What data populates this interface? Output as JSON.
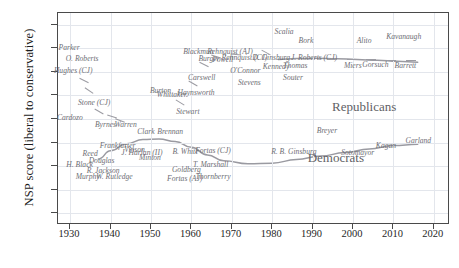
{
  "chart_data": {
    "type": "scatter",
    "title": "",
    "xlabel": "",
    "ylabel": "NSP score (liberal to conservative)",
    "xlim": [
      1927,
      2024
    ],
    "ylim": [
      -0.9,
      0.9
    ],
    "grid": true,
    "legend_position": "inline-annotation",
    "xticks": [
      "1930",
      "1940",
      "1950",
      "1960",
      "1970",
      "1980",
      "1990",
      "2000",
      "2010",
      "2020"
    ],
    "xtick_values": [
      1930,
      1940,
      1950,
      1960,
      1970,
      1980,
      1990,
      2000,
      2010,
      2020
    ],
    "yticks": [
      "0.8",
      "0.6",
      "0.4",
      "0.2",
      "0.0",
      "−0.2",
      "−0.4",
      "−0.6",
      "−0.8"
    ],
    "ytick_values": [
      0.8,
      0.6,
      0.4,
      0.2,
      0.0,
      -0.2,
      -0.4,
      -0.6,
      -0.8
    ],
    "annotations": [
      {
        "text": "Republicans",
        "x": 2003,
        "y": 0.09
      },
      {
        "text": "Democrats",
        "x": 1996,
        "y": -0.34
      }
    ],
    "points": [
      {
        "label": "Parker",
        "x": 1930.0,
        "y": 0.6
      },
      {
        "label": "O. Roberts",
        "x": 1933.2,
        "y": 0.51
      },
      {
        "label": "Hughes (CJ)",
        "x": 1931.0,
        "y": 0.41
      },
      {
        "label": "Cardozo",
        "x": 1930.2,
        "y": 0.01
      },
      {
        "label": "Stone (CJ)",
        "x": 1936.2,
        "y": 0.14
      },
      {
        "label": "Byrnes",
        "x": 1939.0,
        "y": -0.05
      },
      {
        "label": "Warren",
        "x": 1944.0,
        "y": -0.05
      },
      {
        "label": "Reed",
        "x": 1935.2,
        "y": -0.3
      },
      {
        "label": "H. Black",
        "x": 1932.6,
        "y": -0.39
      },
      {
        "label": "Murphy",
        "x": 1934.6,
        "y": -0.49
      },
      {
        "label": "Douglas",
        "x": 1938.0,
        "y": -0.36
      },
      {
        "label": "R. Jackson",
        "x": 1938.4,
        "y": -0.44
      },
      {
        "label": "W. Rutledge",
        "x": 1941.2,
        "y": -0.49
      },
      {
        "label": "Frankfurter",
        "x": 1942.0,
        "y": -0.23
      },
      {
        "label": "Vinson",
        "x": 1946.2,
        "y": -0.26
      },
      {
        "label": "J. Harlan (II)",
        "x": 1948.0,
        "y": -0.29
      },
      {
        "label": "Minton",
        "x": 1950.0,
        "y": -0.33
      },
      {
        "label": "Clark",
        "x": 1949.0,
        "y": -0.11
      },
      {
        "label": "Brennan",
        "x": 1955.0,
        "y": -0.11
      },
      {
        "label": "Burton",
        "x": 1952.6,
        "y": 0.24
      },
      {
        "label": "Whittaker",
        "x": 1955.4,
        "y": 0.2
      },
      {
        "label": "Stewart",
        "x": 1959.4,
        "y": 0.06
      },
      {
        "label": "B. White",
        "x": 1958.8,
        "y": -0.28
      },
      {
        "label": "Goldberg",
        "x": 1959.0,
        "y": -0.43
      },
      {
        "label": "Fortas (AJ)",
        "x": 1958.6,
        "y": -0.51
      },
      {
        "label": "Fortas (CJ)",
        "x": 1965.6,
        "y": -0.27
      },
      {
        "label": "T. Marshall",
        "x": 1965.0,
        "y": -0.39
      },
      {
        "label": "Thornberry",
        "x": 1965.6,
        "y": -0.49
      },
      {
        "label": "Haynsworth",
        "x": 1961.4,
        "y": 0.22
      },
      {
        "label": "Carswell",
        "x": 1962.8,
        "y": 0.35
      },
      {
        "label": "Blackmun",
        "x": 1962.0,
        "y": 0.57
      },
      {
        "label": "Burger",
        "x": 1964.6,
        "y": 0.51
      },
      {
        "label": "Powell",
        "x": 1968.0,
        "y": 0.5
      },
      {
        "label": "Rehnquist (AJ)",
        "x": 1969.8,
        "y": 0.57
      },
      {
        "label": "Rehnquist (CJ)",
        "x": 1973.4,
        "y": 0.52
      },
      {
        "label": "O'Connor",
        "x": 1973.6,
        "y": 0.41
      },
      {
        "label": "Stevens",
        "x": 1974.6,
        "y": 0.31
      },
      {
        "label": "Scalia",
        "x": 1983.2,
        "y": 0.74
      },
      {
        "label": "Bork",
        "x": 1988.6,
        "y": 0.66
      },
      {
        "label": "D. Ginsburg",
        "x": 1980.0,
        "y": 0.52
      },
      {
        "label": "Kennedy",
        "x": 1981.2,
        "y": 0.44
      },
      {
        "label": "Souter",
        "x": 1985.4,
        "y": 0.35
      },
      {
        "label": "Thomas",
        "x": 1986.0,
        "y": 0.45
      },
      {
        "label": "J. Roberts (CJ)",
        "x": 1990.6,
        "y": 0.52
      },
      {
        "label": "Alito",
        "x": 2003.0,
        "y": 0.66
      },
      {
        "label": "Kavanaugh",
        "x": 2012.8,
        "y": 0.7
      },
      {
        "label": "Miers",
        "x": 2000.2,
        "y": 0.45
      },
      {
        "label": "Gorsuch",
        "x": 2005.8,
        "y": 0.46
      },
      {
        "label": "Barrett",
        "x": 2013.2,
        "y": 0.45
      },
      {
        "label": "R. B. Ginsburg",
        "x": 1985.6,
        "y": -0.28
      },
      {
        "label": "Breyer",
        "x": 1993.8,
        "y": -0.1
      },
      {
        "label": "Sotomayor",
        "x": 2001.4,
        "y": -0.29
      },
      {
        "label": "Kagan",
        "x": 2008.4,
        "y": -0.23
      },
      {
        "label": "Garland",
        "x": 2016.4,
        "y": -0.19
      }
    ],
    "trend_lines": [
      {
        "name": "Republicans",
        "x": [
          1981.5,
          1986,
          1991,
          1996,
          2001,
          2006,
          2011,
          2016
        ],
        "y": [
          0.505,
          0.513,
          0.515,
          0.512,
          0.505,
          0.498,
          0.49,
          0.482
        ]
      },
      {
        "name": "Democrats",
        "x": [
          1937,
          1940,
          1944,
          1948,
          1952,
          1956,
          1960,
          1964,
          1968,
          1974,
          1980,
          1986,
          1992,
          1998,
          2004,
          2010,
          2016
        ],
        "y": [
          -0.34,
          -0.27,
          -0.21,
          -0.175,
          -0.17,
          -0.19,
          -0.24,
          -0.305,
          -0.355,
          -0.38,
          -0.375,
          -0.345,
          -0.315,
          -0.285,
          -0.255,
          -0.225,
          -0.215
        ]
      }
    ]
  }
}
